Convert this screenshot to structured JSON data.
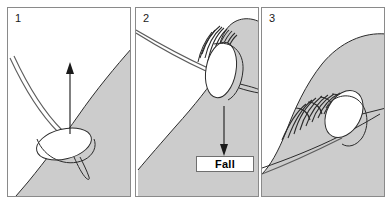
{
  "figure": {
    "background_color": "#ffffff",
    "water_color": "#cccccc",
    "line_color": "#2b2b2b",
    "panel_border_color": "#8a8a8a"
  },
  "panels": [
    {
      "number": "1",
      "caption": "",
      "arrow": {
        "direction": "up",
        "label": ""
      },
      "elements": [
        "board",
        "leash",
        "wave-face",
        "up-arrow"
      ]
    },
    {
      "number": "2",
      "caption": "Fall",
      "arrow": {
        "direction": "down",
        "label": "Fall"
      },
      "elements": [
        "board",
        "leash",
        "wave-lip",
        "whitewater-hatching",
        "down-arrow",
        "fall-callout"
      ]
    },
    {
      "number": "3",
      "caption": "",
      "arrow": {
        "direction": "none",
        "label": ""
      },
      "elements": [
        "board",
        "leash",
        "breaking-wave",
        "spray-lines"
      ]
    }
  ]
}
